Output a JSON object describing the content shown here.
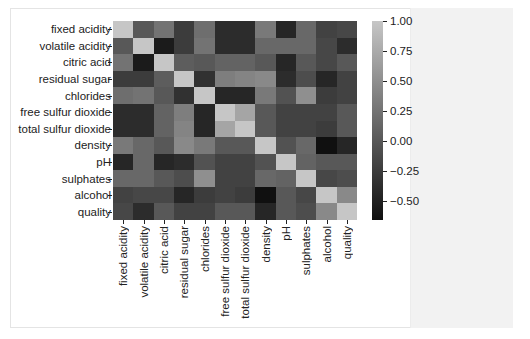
{
  "chart_data": {
    "type": "heatmap",
    "title": "",
    "xlabel": "",
    "ylabel": "",
    "labels": [
      "fixed acidity",
      "volatile acidity",
      "citric acid",
      "residual sugar",
      "chlorides",
      "free sulfur dioxide",
      "total sulfur dioxide",
      "density",
      "pH",
      "sulphates",
      "alcohol",
      "quality"
    ],
    "matrix": [
      [
        1.0,
        0.0,
        0.25,
        -0.25,
        0.2,
        -0.4,
        -0.4,
        0.3,
        -0.45,
        0.15,
        -0.2,
        -0.15
      ],
      [
        0.0,
        1.0,
        -0.55,
        -0.25,
        0.25,
        -0.4,
        -0.4,
        0.15,
        0.15,
        0.15,
        -0.15,
        -0.4
      ],
      [
        0.25,
        -0.55,
        1.0,
        0.05,
        0.0,
        0.1,
        0.1,
        0.0,
        -0.45,
        0.0,
        -0.15,
        0.0
      ],
      [
        -0.25,
        -0.25,
        0.05,
        1.0,
        -0.35,
        0.35,
        0.4,
        0.45,
        -0.4,
        -0.1,
        -0.45,
        -0.2
      ],
      [
        0.2,
        0.25,
        0.0,
        -0.35,
        1.0,
        -0.45,
        -0.45,
        0.3,
        -0.05,
        0.5,
        -0.25,
        -0.2
      ],
      [
        -0.4,
        -0.4,
        0.1,
        0.35,
        -0.45,
        1.0,
        0.7,
        0.0,
        -0.2,
        -0.2,
        -0.2,
        0.0
      ],
      [
        -0.4,
        -0.4,
        0.1,
        0.4,
        -0.45,
        0.7,
        1.0,
        0.0,
        -0.2,
        -0.2,
        -0.25,
        0.0
      ],
      [
        0.3,
        0.15,
        0.0,
        0.45,
        0.3,
        0.0,
        0.0,
        1.0,
        -0.05,
        0.15,
        -0.65,
        -0.45
      ],
      [
        -0.45,
        0.15,
        -0.45,
        -0.4,
        -0.05,
        -0.2,
        -0.2,
        -0.05,
        1.0,
        0.1,
        0.0,
        0.0
      ],
      [
        0.15,
        0.15,
        0.0,
        -0.1,
        0.5,
        -0.2,
        -0.2,
        0.15,
        0.1,
        1.0,
        -0.15,
        -0.1
      ],
      [
        -0.2,
        -0.15,
        -0.15,
        -0.45,
        -0.25,
        -0.2,
        -0.25,
        -0.65,
        0.0,
        -0.15,
        1.0,
        0.45
      ],
      [
        -0.15,
        -0.4,
        0.0,
        -0.2,
        -0.2,
        0.0,
        0.0,
        -0.45,
        0.0,
        -0.1,
        0.45,
        1.0
      ]
    ],
    "colorbar": {
      "vmin": -0.66,
      "vmax": 1.0,
      "ticks": [
        1.0,
        0.75,
        0.5,
        0.25,
        0.0,
        -0.25,
        -0.5
      ],
      "tick_labels": [
        "1.00",
        "0.75",
        "0.50",
        "0.25",
        "0.00",
        "−0.25",
        "−0.50"
      ],
      "color_high": "#c6c6c6",
      "color_low": "#0f0f0f"
    },
    "grid": false,
    "legend_position": "right"
  }
}
